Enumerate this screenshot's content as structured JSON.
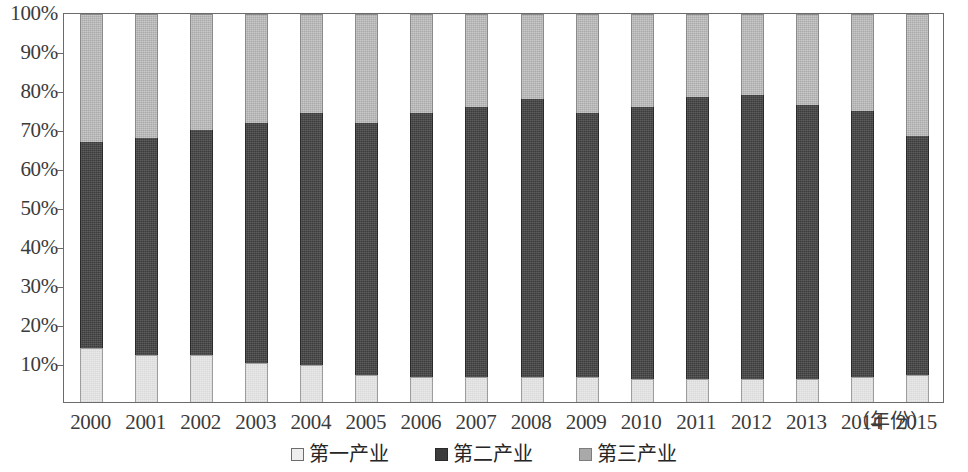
{
  "chart_data": {
    "type": "bar",
    "subtype": "stacked-percentage-column",
    "title": "",
    "xlabel": "（年份）",
    "ylabel": "",
    "ylim": [
      0,
      100
    ],
    "ytick_labels": [
      "100%",
      "90%",
      "80%",
      "70%",
      "60%",
      "50%",
      "40%",
      "30%",
      "20%",
      "10%"
    ],
    "ytick_values": [
      100,
      90,
      80,
      70,
      60,
      50,
      40,
      30,
      20,
      10
    ],
    "grid": false,
    "legend_position": "bottom-center",
    "categories": [
      "2000",
      "2001",
      "2002",
      "2003",
      "2004",
      "2005",
      "2006",
      "2007",
      "2008",
      "2009",
      "2010",
      "2011",
      "2012",
      "2013",
      "2014",
      "2015"
    ],
    "series": [
      {
        "name": "第一产业",
        "color": "#e9e9e9",
        "values": [
          14.0,
          12.0,
          12.0,
          10.0,
          9.5,
          7.0,
          6.5,
          6.5,
          6.5,
          6.5,
          6.0,
          6.0,
          6.0,
          6.0,
          6.5,
          7.0
        ]
      },
      {
        "name": "第二产业",
        "color": "#3c3c3c",
        "values": [
          53.0,
          56.0,
          58.0,
          62.0,
          65.0,
          65.0,
          68.0,
          69.5,
          71.5,
          68.0,
          70.0,
          72.5,
          73.0,
          70.5,
          68.5,
          61.5
        ]
      },
      {
        "name": "第三产业",
        "color": "#a9a9a9",
        "values": [
          33.0,
          32.0,
          30.0,
          28.0,
          25.5,
          28.0,
          25.5,
          24.0,
          22.0,
          25.5,
          24.0,
          21.5,
          21.0,
          23.5,
          25.0,
          31.5
        ]
      }
    ],
    "cumulative_tops": {
      "primary": [
        14.0,
        12.0,
        12.0,
        10.0,
        9.5,
        7.0,
        6.5,
        6.5,
        6.5,
        6.5,
        6.0,
        6.0,
        6.0,
        6.0,
        6.5,
        7.0
      ],
      "secondary": [
        67.0,
        68.0,
        70.0,
        72.0,
        74.5,
        72.0,
        74.5,
        76.0,
        78.0,
        74.5,
        76.0,
        78.5,
        79.0,
        76.5,
        75.0,
        68.5
      ],
      "tertiary": [
        100,
        100,
        100,
        100,
        100,
        100,
        100,
        100,
        100,
        100,
        100,
        100,
        100,
        100,
        100,
        100
      ]
    }
  },
  "axes": {
    "x_unit_label": "（年份）"
  },
  "legend": {
    "items": [
      {
        "label": "第一产业",
        "swatch": "light-square-swatch"
      },
      {
        "label": "第二产业",
        "swatch": "dark-square-swatch"
      },
      {
        "label": "第三产业",
        "swatch": "gray-square-swatch"
      }
    ]
  },
  "colors": {
    "primary": "#e9e9e9",
    "secondary": "#3c3c3c",
    "tertiary": "#a9a9a9",
    "axis": "#6b6b6b",
    "text": "#3b3b3b"
  }
}
